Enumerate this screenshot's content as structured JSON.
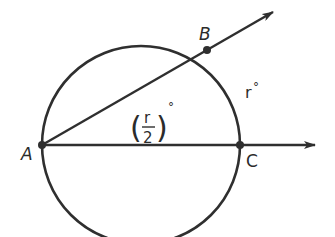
{
  "diagram": {
    "type": "geometry",
    "colors": {
      "stroke": "#2f2f2f",
      "background": "#ffffff"
    },
    "points": {
      "A": {
        "label": "A",
        "x": 42,
        "y": 145
      },
      "B": {
        "label": "B",
        "x": 207,
        "y": 50
      },
      "C": {
        "label": "C",
        "x": 240,
        "y": 145
      }
    },
    "circle": {
      "cx": 141,
      "cy": 145,
      "r": 99
    },
    "rays": [
      {
        "name": "ray-AB",
        "from": "A",
        "through": "B"
      },
      {
        "name": "ray-AC",
        "from": "A",
        "through": "C"
      }
    ],
    "labels": {
      "arc_measure_var": "r",
      "arc_measure_deg": "°",
      "angle_numerator": "r",
      "angle_denominator": "2",
      "angle_open_paren": "(",
      "angle_close_paren": ")",
      "angle_deg": "°"
    }
  }
}
